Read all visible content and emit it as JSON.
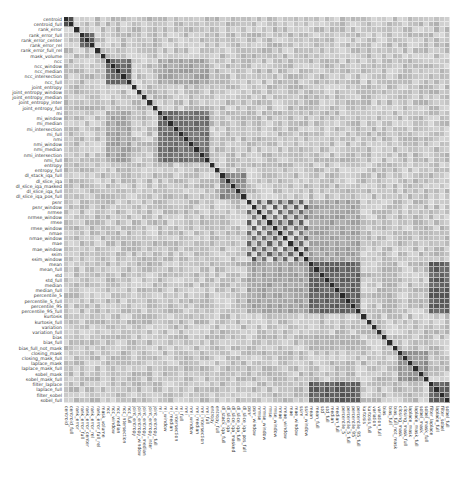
{
  "chart_data": {
    "type": "heatmap",
    "title": "",
    "xlabel": "",
    "ylabel": "",
    "colormap": "greys",
    "color_low": "#f2f2f2",
    "color_high": "#2a2a2a",
    "colorbar": false,
    "labels": [
      "centroid",
      "centroid_full",
      "rank_error",
      "rank_error_full",
      "rank_error_center",
      "rank_error_rel",
      "rank_error_full_rel",
      "mask_volume",
      "ncc",
      "ncc_window",
      "ncc_median",
      "ncc_intersection",
      "ncc_full",
      "joint_entropy",
      "joint_entropy_window",
      "joint_entropy_median",
      "joint_entropy_inter",
      "joint_entropy_full",
      "mi",
      "mi_window",
      "mi_median",
      "mi_intersection",
      "mi_full",
      "nmi",
      "nmi_window",
      "nmi_median",
      "nmi_intersection",
      "nmi_full",
      "entropy",
      "entropy_full",
      "dl_stack_iqa_full",
      "dl_slice_iqa",
      "dl_slice_iqa_masked",
      "dl_slice_iqa_full",
      "dl_slice_iqa_pos_full",
      "psnr",
      "psnr_window",
      "nrmse",
      "nrmse_window",
      "rmse",
      "rmse_window",
      "nmae",
      "nmae_window",
      "mae",
      "mae_window",
      "ssim",
      "ssim_window",
      "mean",
      "mean_full",
      "std",
      "std_full",
      "median",
      "median_full",
      "percentile_5",
      "percentile_5_full",
      "percentile_95",
      "percentile_95_full",
      "kurtosis",
      "kurtosis_full",
      "variation",
      "variation_full",
      "bias",
      "bias_full",
      "bias_full_not_mask",
      "closing_mask",
      "closing_mask_full",
      "laplace_mask",
      "laplace_mask_full",
      "sobel_mask",
      "sobel_mask_full",
      "filter_laplace",
      "laplace_full",
      "filter_sobel",
      "sobel_full"
    ],
    "blocks": [
      {
        "name": "centroid",
        "start": 0,
        "end": 1,
        "value": 0.85
      },
      {
        "name": "rank_error_group",
        "start": 3,
        "end": 5,
        "value": 0.8
      },
      {
        "name": "ncc_group",
        "start": 8,
        "end": 12,
        "value": 0.75
      },
      {
        "name": "mi_nmi_group",
        "start": 18,
        "end": 27,
        "value": 0.72
      },
      {
        "name": "dl_iqa_group",
        "start": 30,
        "end": 34,
        "value": 0.6
      },
      {
        "name": "intensity_stats_group",
        "start": 47,
        "end": 56,
        "value": 0.78
      },
      {
        "name": "mask_edge_group",
        "start": 64,
        "end": 69,
        "value": 0.55
      },
      {
        "name": "filter_group",
        "start": 70,
        "end": 73,
        "value": 0.8
      }
    ],
    "checker_block": {
      "name": "error_metrics",
      "start": 35,
      "end": 46,
      "value": 0.8
    },
    "cross_blocks": [
      {
        "rows": [
          47,
          56
        ],
        "cols": [
          70,
          73
        ],
        "value": 0.8
      },
      {
        "rows": [
          8,
          12
        ],
        "cols": [
          18,
          27
        ],
        "value": 0.45
      },
      {
        "rows": [
          35,
          46
        ],
        "cols": [
          47,
          56
        ],
        "value": 0.45
      },
      {
        "rows": [
          61,
          63
        ],
        "cols": [
          47,
          56
        ],
        "value": 0.35
      }
    ],
    "diagonal": 1.0,
    "value_range": [
      0,
      1
    ]
  }
}
